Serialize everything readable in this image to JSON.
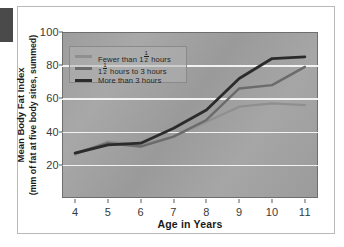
{
  "chart_data": {
    "type": "line",
    "title": "",
    "xlabel": "Age in Years",
    "ylabel_line1": "Mean Body Fat Index",
    "ylabel_line2": "(mm of fat at five body sites, summed)",
    "x": [
      4,
      5,
      6,
      7,
      8,
      9,
      10,
      11
    ],
    "xlim": [
      3.6,
      11.4
    ],
    "ylim": [
      0,
      100
    ],
    "xticks": [
      "4",
      "5",
      "6",
      "7",
      "8",
      "9",
      "10",
      "11"
    ],
    "yticks": [
      "100",
      "80",
      "60",
      "40",
      "20"
    ],
    "ytick_values": [
      100,
      80,
      60,
      40,
      20
    ],
    "grid": "horizontal",
    "gridlines": [
      80,
      60,
      40,
      20
    ],
    "legend_position": "upper-left-inside",
    "series": [
      {
        "name": "Fewer than 1½ hours",
        "name_prefix": "Fewer than 1",
        "name_fraction_num": "1",
        "name_fraction_den": "2",
        "name_suffix": " hours",
        "color": "#8f8f8f",
        "width": 2.2,
        "values": [
          26,
          34,
          32,
          37,
          46,
          55,
          57,
          56
        ]
      },
      {
        "name": "1½ hours to 3 hours",
        "name_prefix": "1",
        "name_fraction_num": "1",
        "name_fraction_den": "2",
        "name_suffix": " hours to 3 hours",
        "color": "#6b6b6b",
        "width": 2.4,
        "values": [
          27,
          33,
          31,
          37,
          47,
          66,
          68,
          79
        ]
      },
      {
        "name": "More than 3 hours",
        "name_prefix": "More than 3 hours",
        "name_fraction_num": "",
        "name_fraction_den": "",
        "name_suffix": "",
        "color": "#2b2b2b",
        "width": 2.8,
        "values": [
          27,
          32,
          33,
          42,
          53,
          72,
          84,
          85
        ]
      }
    ]
  }
}
